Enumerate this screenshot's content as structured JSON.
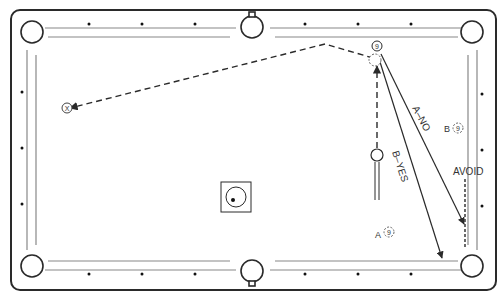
{
  "diagram": {
    "colors": {
      "line": "#2a2a2a",
      "rail_inner": "#888888",
      "background": "#ffffff"
    },
    "labels": {
      "path_a": "A–NO",
      "path_b": "B–YES",
      "avoid": "AVOID",
      "position_a": "A",
      "position_b": "B",
      "target_ball_number": "9",
      "pocket_marker": "X"
    },
    "balls": [
      {
        "id": "nine-ball-top",
        "number": "9",
        "x": 377,
        "y": 46
      },
      {
        "id": "nine-ball-a",
        "number": "9",
        "x": 389,
        "y": 232,
        "prefix": "A"
      },
      {
        "id": "nine-ball-b",
        "number": "9",
        "x": 458,
        "y": 128,
        "prefix": "B"
      },
      {
        "id": "ghost-ball",
        "x": 375,
        "y": 60
      },
      {
        "id": "object-ball",
        "x": 377,
        "y": 155
      },
      {
        "id": "cue-ball",
        "x": 236,
        "y": 197
      }
    ],
    "diamonds": {
      "top": [
        89,
        142,
        195,
        305,
        358,
        411
      ],
      "bottom": [
        89,
        142,
        195,
        305,
        358,
        411
      ],
      "left": [
        92,
        148,
        204
      ],
      "right": [
        94,
        150,
        206
      ]
    }
  }
}
